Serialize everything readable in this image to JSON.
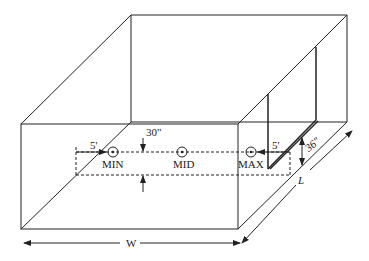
{
  "diagram": {
    "title": "",
    "labels": {
      "offset_left": "5'",
      "offset_right": "5'",
      "height_30": "30\"",
      "height_36": "36\"",
      "width": "W",
      "length": "L"
    },
    "points": [
      {
        "id": "min",
        "label": "MIN"
      },
      {
        "id": "mid",
        "label": "MID"
      },
      {
        "id": "max",
        "label": "MAX"
      }
    ],
    "colors": {
      "line": "#222222",
      "background": "#ffffff"
    }
  }
}
